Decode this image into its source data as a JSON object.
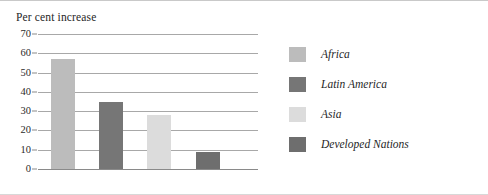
{
  "chart_data": {
    "type": "bar",
    "title": "Per cent increase",
    "xlabel": "",
    "ylabel": "Per cent increase",
    "categories": [
      "Africa",
      "Latin America",
      "Asia",
      "Developed Nations"
    ],
    "values": [
      57,
      35,
      28,
      9
    ],
    "ylim": [
      0,
      70
    ],
    "ytick_labels": [
      "70",
      "60",
      "50",
      "40",
      "30",
      "20",
      "10",
      "0"
    ],
    "ytick_values": [
      70,
      60,
      50,
      40,
      30,
      20,
      10,
      0
    ],
    "grid": true,
    "legend_position": "right",
    "series": [
      {
        "name": "Africa",
        "value": 57,
        "color": "#bcbcbc"
      },
      {
        "name": "Latin America",
        "value": 35,
        "color": "#767676"
      },
      {
        "name": "Asia",
        "value": 28,
        "color": "#dcdcdc"
      },
      {
        "name": "Developed Nations",
        "value": 9,
        "color": "#6e6e6e"
      }
    ]
  },
  "legend": {
    "items": [
      {
        "label": "Africa",
        "color": "#bcbcbc"
      },
      {
        "label": "Latin America",
        "color": "#767676"
      },
      {
        "label": "Asia",
        "color": "#dcdcdc"
      },
      {
        "label": "Developed Nations",
        "color": "#6e6e6e"
      }
    ]
  },
  "colors": {
    "gridline": "#a8a8a8",
    "axis": "#8a8a8a",
    "text": "#1f1f1f",
    "background": "#ffffff"
  }
}
